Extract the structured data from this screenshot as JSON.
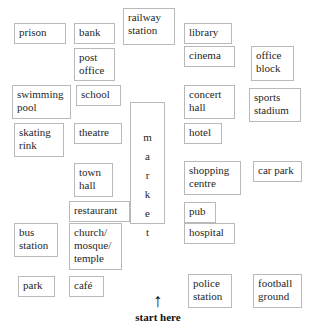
{
  "diagram": {
    "background_color": "#ffffff",
    "border_color": "#b9b9b9",
    "text_color": "#1f1f1f",
    "places": [
      {
        "label": "prison",
        "x": 14,
        "y": 23,
        "w": 52,
        "h": 21
      },
      {
        "label": "bank",
        "x": 74,
        "y": 23,
        "w": 41,
        "h": 21
      },
      {
        "label": "railway\nstation",
        "x": 123,
        "y": 8,
        "w": 52,
        "h": 37
      },
      {
        "label": "library",
        "x": 184,
        "y": 23,
        "w": 48,
        "h": 21
      },
      {
        "label": "post\noffice",
        "x": 74,
        "y": 48,
        "w": 41,
        "h": 33
      },
      {
        "label": "cinema",
        "x": 184,
        "y": 46,
        "w": 51,
        "h": 21
      },
      {
        "label": "office\nblock",
        "x": 251,
        "y": 46,
        "w": 43,
        "h": 35
      },
      {
        "label": "swimming\npool",
        "x": 12,
        "y": 85,
        "w": 59,
        "h": 34
      },
      {
        "label": "school",
        "x": 76,
        "y": 85,
        "w": 45,
        "h": 21
      },
      {
        "label": "concert\nhall",
        "x": 184,
        "y": 85,
        "w": 51,
        "h": 34
      },
      {
        "label": "sports\nstadium",
        "x": 249,
        "y": 88,
        "w": 52,
        "h": 34
      },
      {
        "label": "skating\nrink",
        "x": 14,
        "y": 123,
        "w": 50,
        "h": 34
      },
      {
        "label": "theatre",
        "x": 74,
        "y": 123,
        "w": 48,
        "h": 21
      },
      {
        "label": "hotel",
        "x": 184,
        "y": 123,
        "w": 38,
        "h": 21
      },
      {
        "label": "town\nhall",
        "x": 74,
        "y": 163,
        "w": 39,
        "h": 34
      },
      {
        "label": "shopping\ncentre",
        "x": 184,
        "y": 161,
        "w": 57,
        "h": 34
      },
      {
        "label": "car park",
        "x": 253,
        "y": 161,
        "w": 49,
        "h": 21
      },
      {
        "label": "restaurant",
        "x": 69,
        "y": 201,
        "w": 61,
        "h": 21
      },
      {
        "label": "pub",
        "x": 184,
        "y": 202,
        "w": 32,
        "h": 21
      },
      {
        "label": "bus\nstation",
        "x": 14,
        "y": 223,
        "w": 44,
        "h": 34
      },
      {
        "label": "church/\nmosque/\ntemple",
        "x": 69,
        "y": 223,
        "w": 53,
        "h": 47
      },
      {
        "label": "hospital",
        "x": 184,
        "y": 223,
        "w": 51,
        "h": 21
      },
      {
        "label": "park",
        "x": 18,
        "y": 276,
        "w": 37,
        "h": 21
      },
      {
        "label": "café",
        "x": 69,
        "y": 276,
        "w": 35,
        "h": 21
      },
      {
        "label": "police\nstation",
        "x": 188,
        "y": 274,
        "w": 44,
        "h": 34
      },
      {
        "label": "football\nground",
        "x": 253,
        "y": 274,
        "w": 49,
        "h": 34
      }
    ],
    "market": {
      "name": "market",
      "letters": [
        "m",
        "a",
        "r",
        "k",
        "e",
        "t"
      ],
      "x": 130,
      "y": 102,
      "w": 35,
      "h": 122
    },
    "start": {
      "arrow_icon": "up-arrow",
      "arrow_glyph": "↑",
      "label": "start here"
    }
  }
}
